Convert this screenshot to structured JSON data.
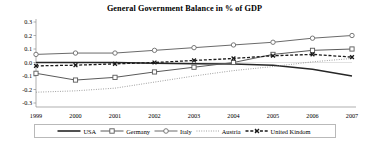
{
  "chart_data": {
    "type": "line",
    "title": "General Government Balance in % of GDP",
    "xlabel": "",
    "ylabel": "",
    "categories": [
      "1999",
      "2000",
      "2001",
      "2002",
      "2003",
      "2004",
      "2005",
      "2006",
      "2007"
    ],
    "x": [
      1999,
      2000,
      2001,
      2002,
      2003,
      2004,
      2005,
      2006,
      2007
    ],
    "ylim": [
      -0.3,
      0.3
    ],
    "yticks": [
      "0.3",
      "0.2",
      "0.1",
      "0.0",
      "-0.1",
      "-0.2",
      "-0.3"
    ],
    "ytick_values": [
      0.3,
      0.2,
      0.1,
      0.0,
      -0.1,
      -0.2,
      -0.3
    ],
    "grid": false,
    "legend_position": "bottom",
    "series": [
      {
        "name": "USA",
        "style": "solid",
        "marker": "none",
        "color": "#262626",
        "values": [
          0.0,
          0.0,
          0.0,
          -0.005,
          -0.01,
          -0.012,
          -0.02,
          -0.05,
          -0.1
        ]
      },
      {
        "name": "Germany",
        "style": "solid",
        "marker": "square",
        "color": "#5a5a5a",
        "values": [
          -0.08,
          -0.13,
          -0.11,
          -0.07,
          -0.035,
          0.0,
          0.06,
          0.09,
          0.1
        ]
      },
      {
        "name": "Italy",
        "style": "solid",
        "marker": "circle",
        "color": "#6b6b6b",
        "values": [
          0.06,
          0.07,
          0.07,
          0.09,
          0.11,
          0.13,
          0.15,
          0.18,
          0.2
        ]
      },
      {
        "name": "Austria",
        "style": "dotted",
        "marker": "none",
        "color": "#8a8a8a",
        "values": [
          -0.22,
          -0.21,
          -0.19,
          -0.145,
          -0.1,
          -0.06,
          -0.03,
          0.005,
          0.03
        ]
      },
      {
        "name": "United Kindom",
        "style": "dashed",
        "marker": "x",
        "color": "#1a1a1a",
        "values": [
          -0.025,
          -0.02,
          -0.01,
          0.0,
          0.015,
          0.03,
          0.05,
          0.06,
          0.04
        ]
      }
    ]
  },
  "legend": {
    "items": [
      {
        "label": "USA"
      },
      {
        "label": "Germany"
      },
      {
        "label": "Italy"
      },
      {
        "label": "Austria"
      },
      {
        "label": "United Kindom"
      }
    ]
  },
  "colors": {
    "axis": "#8d8d8d",
    "text": "#000000",
    "legend_border": "#b9b9b9",
    "background": "#ffffff"
  }
}
